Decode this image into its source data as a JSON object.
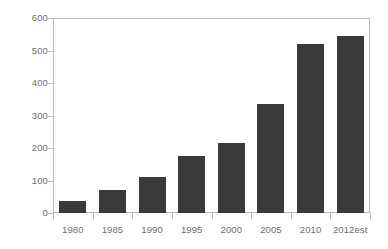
{
  "chart_data": {
    "type": "bar",
    "title": "",
    "subtitle": "",
    "xlabel": "",
    "ylabel": "",
    "categories": [
      "1980",
      "1985",
      "1990",
      "1995",
      "2000",
      "2005",
      "2010",
      "2012est"
    ],
    "values": [
      38,
      70,
      110,
      175,
      215,
      335,
      520,
      545
    ],
    "series": [
      {
        "name": "",
        "values": [
          38,
          70,
          110,
          175,
          215,
          335,
          520,
          545
        ]
      }
    ],
    "ylim": [
      0,
      600
    ],
    "y_ticks": [
      0,
      100,
      200,
      300,
      400,
      500,
      600
    ],
    "y_tick_labels": [
      "0",
      "100",
      "200",
      "300",
      "400",
      "500",
      "600"
    ],
    "grid": false,
    "legend": false,
    "legend_position": "none",
    "annotations": [],
    "colors": {
      "bar": "#3a3a3a",
      "frame": "#b9b9b9",
      "tick": "#b9b9b9",
      "text": "#6e6e6e",
      "background": "#ffffff"
    }
  }
}
